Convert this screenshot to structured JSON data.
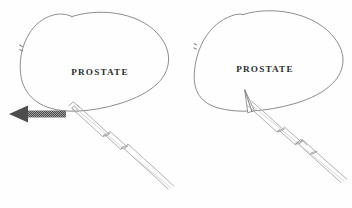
{
  "figure": {
    "width": 352,
    "height": 208,
    "background_color": "#fefefe",
    "outline_color": "#8d8d8d",
    "device_color": "#a8a8a8",
    "label_color": "#2e2e2e",
    "arrow_color": "#555555"
  },
  "panels": [
    {
      "id": "panel-left",
      "caption": "",
      "organ_label": "PROSTATE",
      "organ_label_x": 100,
      "organ_label_y": 75,
      "stage_description": "Device positioned at prostate capsule, needle retracted; arrow indicates direction of traction",
      "has_direction_arrow": true,
      "needle_penetrates": false,
      "arrow": {
        "name": "direction-arrow",
        "points_toward": "left",
        "x_start": 66,
        "x_end": 9,
        "y": 114,
        "color": "#555555",
        "style": "stippled-solid"
      },
      "device": {
        "name": "insertion-device-shaft",
        "tip_x": 72,
        "tip_y": 110,
        "end_x": 170,
        "end_y": 200,
        "notch_count": 3
      },
      "edge_tick": {
        "x": 21,
        "y": 48
      }
    },
    {
      "id": "panel-right",
      "caption": "",
      "organ_label": "PROSTATE",
      "organ_label_x": 265,
      "organ_label_y": 72,
      "stage_description": "Needle advanced, tip penetrating prostate parenchyma through the capsule",
      "has_direction_arrow": false,
      "needle_penetrates": true,
      "needle_tip": {
        "name": "needle-tip-wedge",
        "entry_x": 249,
        "entry_y": 112,
        "apex_x": 245,
        "apex_y": 90
      },
      "device": {
        "name": "insertion-device-shaft",
        "tip_x": 249,
        "tip_y": 104,
        "end_x": 345,
        "end_y": 192,
        "notch_count": 3
      },
      "edge_tick": {
        "x": 196,
        "y": 46
      }
    }
  ],
  "legend": {
    "items": []
  }
}
